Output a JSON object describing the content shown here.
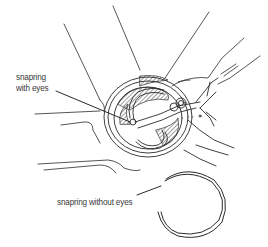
{
  "figure": {
    "labels": {
      "with_eyes_line1": "snapring",
      "with_eyes_line2": "with eyes",
      "without_eyes": "snapring without eyes"
    },
    "colors": {
      "background": "#ffffff",
      "ink": "#2a2a2a",
      "label_text": "#3a3a3a"
    }
  }
}
